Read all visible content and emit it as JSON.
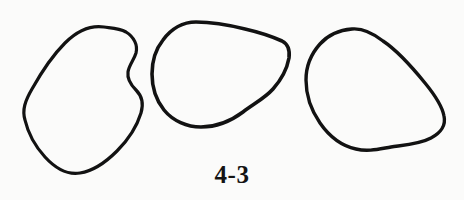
{
  "figure": {
    "caption": "4-3",
    "background_color": "#fbfbfa",
    "ink_color": "#121212",
    "width": 464,
    "height": 200,
    "shapes": [
      {
        "name": "left-blob",
        "label": "left-blob",
        "stroke_width": 3.2,
        "bbox": [
          24,
          26,
          143,
          174
        ],
        "path": "M 104 27 C 90 25 76 32 65 43 C 53 55 41 73 32 89 C 25 101 22 110 25 120 C 28 133 35 146 45 157 C 56 169 68 175 80 173 C 93 171 106 162 117 151 C 128 140 137 126 141 113 C 144 103 142 96 136 90 C 130 84 127 79 128 72 C 129 65 134 60 136 53 C 138 45 134 37 126 32 C 119 28 111 28 104 27 Z"
      },
      {
        "name": "middle-blob",
        "label": "middle-blob",
        "stroke_width": 3.6,
        "bbox": [
          152,
          21,
          290,
          128
        ],
        "path": "M 196 22 C 183 22 171 29 163 40 C 155 50 152 62 152 74 C 152 87 156 100 164 110 C 173 121 187 127 201 127 C 216 127 231 121 243 112 C 255 103 265 98 273 89 C 281 80 287 69 289 58 C 290 50 288 44 282 41 C 271 36 258 32 245 29 C 229 25 212 22 196 22 Z"
      },
      {
        "name": "right-blob",
        "label": "right-blob",
        "stroke_width": 3.4,
        "bbox": [
          306,
          28,
          446,
          152
        ],
        "path": "M 352 29 C 339 30 328 35 320 44 C 311 54 306 66 306 80 C 306 95 311 110 320 123 C 329 136 342 146 356 149 C 368 152 379 149 391 147 C 405 145 420 144 431 138 C 441 133 446 125 444 116 C 442 105 434 94 425 83 C 412 67 398 51 383 41 C 374 34 363 28 352 29 Z"
      }
    ]
  }
}
